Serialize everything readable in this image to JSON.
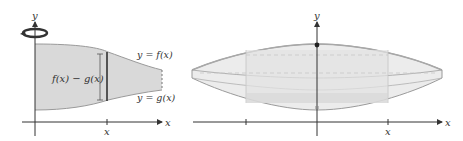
{
  "left_panel": {
    "y_axis_label": "y",
    "x_axis_label": "x",
    "x_tick_label": "x",
    "upper_curve_label": "y = f(x)",
    "lower_curve_label": "y = g(x)",
    "height_label": "f(x) − g(x)",
    "rotation_icon": "rotation-arrow-icon"
  },
  "right_panel": {
    "y_axis_label": "y",
    "x_axis_label": "x",
    "x_tick_label": "x"
  },
  "colors": {
    "region_fill": "#d9d9d9",
    "solid_fill": "#ececec",
    "axis": "#333333",
    "outline": "#9a9a9a",
    "text": "#333333"
  }
}
